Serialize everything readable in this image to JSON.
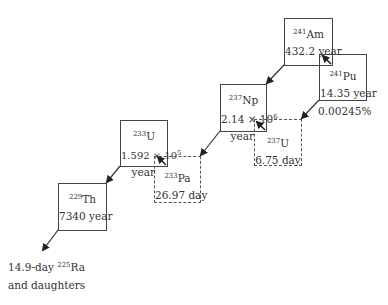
{
  "diagram": {
    "nuclides": [
      {
        "id": "am241",
        "mass": "241",
        "symbol": "Am",
        "half_life": "432.2 year",
        "style": "solid"
      },
      {
        "id": "pu241",
        "mass": "241",
        "symbol": "Pu",
        "half_life": "14.35 year",
        "style": "solid"
      },
      {
        "id": "np237",
        "mass": "237",
        "symbol": "Np",
        "half_life_mantissa": "2.14 × 10",
        "half_life_exp": "6",
        "half_life_unit": "year",
        "style": "solid"
      },
      {
        "id": "u237",
        "mass": "237",
        "symbol": "U",
        "half_life": "6.75 day",
        "style": "dotted"
      },
      {
        "id": "u233",
        "mass": "233",
        "symbol": "U",
        "half_life_mantissa": "1.592 × 10",
        "half_life_exp": "5",
        "half_life_unit": "year",
        "style": "solid"
      },
      {
        "id": "pa233",
        "mass": "233",
        "symbol": "Pa",
        "half_life": "26.97 day",
        "style": "dotted"
      },
      {
        "id": "th229",
        "mass": "229",
        "symbol": "Th",
        "half_life": "7340 year",
        "style": "solid"
      }
    ],
    "branch_label": "0.00245%",
    "terminal": {
      "line1_prefix": "14.9-day ",
      "line1_mass": "225",
      "line1_symbol": "Ra",
      "line2": "and daughters"
    },
    "transitions": [
      {
        "from": "am241",
        "to": "np237",
        "type": "alpha"
      },
      {
        "from": "pu241",
        "to": "am241",
        "type": "beta"
      },
      {
        "from": "pu241",
        "to": "u237",
        "type": "alpha"
      },
      {
        "from": "u237",
        "to": "np237",
        "type": "beta"
      },
      {
        "from": "np237",
        "to": "pa233",
        "type": "alpha"
      },
      {
        "from": "pa233",
        "to": "u233",
        "type": "beta"
      },
      {
        "from": "u233",
        "to": "th229",
        "type": "alpha"
      },
      {
        "from": "th229",
        "to": "ra225",
        "type": "alpha"
      }
    ],
    "colors": {
      "line": "#333333",
      "text": "#333333",
      "background": "#ffffff"
    }
  }
}
